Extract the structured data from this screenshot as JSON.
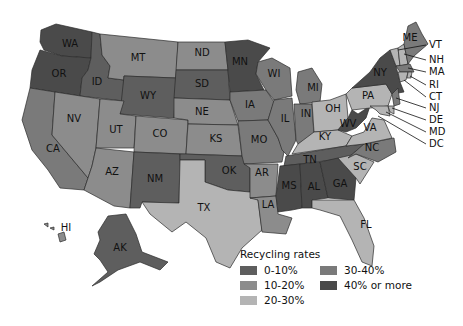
{
  "legend": {
    "title": "Recycling rates",
    "items": [
      {
        "label": "0-10%",
        "color": "#5e5e5e"
      },
      {
        "label": "10-20%",
        "color": "#8c8c8c"
      },
      {
        "label": "20-30%",
        "color": "#b4b4b4"
      },
      {
        "label": "30-40%",
        "color": "#7a7a7a"
      },
      {
        "label": "40% or more",
        "color": "#4a4a4a"
      }
    ]
  },
  "colors": {
    "c0_10": "#5e5e5e",
    "c10_20": "#8c8c8c",
    "c20_30": "#b4b4b4",
    "c30_40": "#7a7a7a",
    "c40_plus": "#4a4a4a"
  },
  "states": {
    "WA": "WA",
    "OR": "OR",
    "CA": "CA",
    "ID": "ID",
    "NV": "NV",
    "MT": "MT",
    "WY": "WY",
    "UT": "UT",
    "AZ": "AZ",
    "CO": "CO",
    "NM": "NM",
    "ND": "ND",
    "SD": "SD",
    "NE": "NE",
    "KS": "KS",
    "OK": "OK",
    "TX": "TX",
    "MN": "MN",
    "IA": "IA",
    "MO": "MO",
    "AR": "AR",
    "LA": "LA",
    "WI": "WI",
    "IL": "IL",
    "MI": "MI",
    "IN": "IN",
    "OH": "OH",
    "KY": "KY",
    "TN": "TN",
    "MS": "MS",
    "AL": "AL",
    "GA": "GA",
    "FL": "FL",
    "SC": "SC",
    "NC": "NC",
    "VA": "VA",
    "WV": "WV",
    "PA": "PA",
    "NY": "NY",
    "ME": "ME",
    "AK": "AK",
    "HI": "HI"
  },
  "callouts": [
    "VT",
    "NH",
    "MA",
    "RI",
    "CT",
    "NJ",
    "DE",
    "MD",
    "DC"
  ]
}
